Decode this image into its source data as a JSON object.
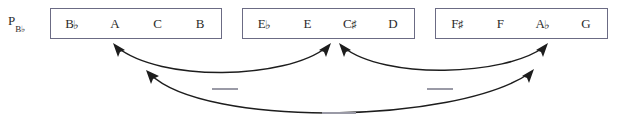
{
  "diagram": {
    "row_label": {
      "base": "P",
      "subscript": "B♭"
    },
    "boxes": [
      {
        "id": "tetrachord-1",
        "pitches": [
          {
            "letter": "B",
            "accidental": "♭"
          },
          {
            "letter": "A",
            "accidental": ""
          },
          {
            "letter": "C",
            "accidental": ""
          },
          {
            "letter": "B",
            "accidental": ""
          }
        ]
      },
      {
        "id": "tetrachord-2",
        "pitches": [
          {
            "letter": "E",
            "accidental": "♭"
          },
          {
            "letter": "E",
            "accidental": ""
          },
          {
            "letter": "C",
            "accidental": "♯"
          },
          {
            "letter": "D",
            "accidental": ""
          }
        ]
      },
      {
        "id": "tetrachord-3",
        "pitches": [
          {
            "letter": "F",
            "accidental": "♯"
          },
          {
            "letter": "F",
            "accidental": ""
          },
          {
            "letter": "A",
            "accidental": "♭"
          },
          {
            "letter": "G",
            "accidental": ""
          }
        ]
      }
    ],
    "arrows": [
      {
        "id": "arc-box1-box2",
        "from": "tetrachord-1",
        "to": "tetrachord-2",
        "double_headed": true
      },
      {
        "id": "arc-box2-box3",
        "from": "tetrachord-2",
        "to": "tetrachord-3",
        "double_headed": true
      },
      {
        "id": "arc-box1-box3",
        "from": "tetrachord-1",
        "to": "tetrachord-3",
        "double_headed": true
      }
    ],
    "blank_labels": [
      {
        "id": "blank-label-left",
        "text": ""
      },
      {
        "id": "blank-label-right",
        "text": ""
      },
      {
        "id": "blank-label-bottom",
        "text": ""
      }
    ],
    "colors": {
      "background": "#ffffff",
      "box_border": "#6b6b84",
      "text": "#2b2b2b",
      "arrow": "#1d1d1d",
      "tick": "#9a9aa6"
    }
  }
}
